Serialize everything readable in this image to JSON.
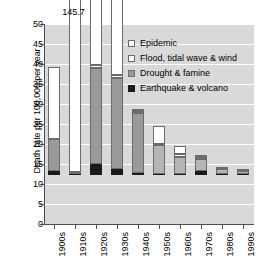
{
  "chart_data": {
    "type": "bar",
    "subtype": "stacked-bar",
    "title": "",
    "xlabel": "",
    "ylabel": "Death rate per 100,000 per year",
    "ylim": [
      0,
      50
    ],
    "ytick_step": 5,
    "yticks": [
      0,
      5,
      10,
      15,
      20,
      25,
      30,
      35,
      40,
      45,
      50
    ],
    "grid": true,
    "grid_orientation": "horizontal",
    "legend_position": "upper-right-inside",
    "categories": [
      "1900s",
      "1910s",
      "1920s",
      "1930s",
      "1940s",
      "1950s",
      "1960s",
      "1970s",
      "1980s",
      "1990s"
    ],
    "series": [
      {
        "name": "Earthquake & volcano",
        "color": "#1a1a1a",
        "values": [
          1.0,
          0.3,
          2.8,
          1.5,
          0.6,
          0.2,
          0.3,
          1.0,
          0.2,
          0.2
        ]
      },
      {
        "name": "Drought & famine",
        "color": "#9a9a9a",
        "values": [
          8.0,
          0.5,
          24.0,
          22.8,
          15.0,
          7.3,
          4.3,
          2.9,
          1.2,
          0.9
        ]
      },
      {
        "name": "Flood, tidal wave & wind",
        "color": "#ffffff",
        "values": [
          18.0,
          144.9,
          0.6,
          0.6,
          0.3,
          0.3,
          0.7,
          0.5,
          0.3,
          0.3
        ]
      },
      {
        "name": "Epidemic",
        "color": "#ffffff",
        "values": [
          0.0,
          0.0,
          16.9,
          22.3,
          0.2,
          4.4,
          1.9,
          0.4,
          0.0,
          0.0
        ]
      }
    ],
    "totals": [
      27.0,
      145.7,
      44.3,
      47.2,
      16.1,
      12.2,
      7.2,
      4.8,
      1.7,
      1.4
    ],
    "annotations": [
      {
        "text": "145.7",
        "category": "1910s",
        "note": "bar value exceeds axis maximum"
      }
    ]
  },
  "legend": {
    "items": [
      {
        "label": "Epidemic",
        "swatch": "epidemic"
      },
      {
        "label": "Flood, tidal wave & wind",
        "swatch": "flood"
      },
      {
        "label": "Drought & famine",
        "swatch": "drought"
      },
      {
        "label": "Earthquake & volcano",
        "swatch": "quake"
      }
    ]
  },
  "axis": {
    "y_title": "Death rate per 100,000 per year",
    "y_labels": [
      "50",
      "45",
      "40",
      "35",
      "30",
      "25",
      "20",
      "15",
      "10",
      "5",
      "0"
    ],
    "x_labels": [
      "1900s",
      "1910s",
      "1920s",
      "1930s",
      "1940s",
      "1950s",
      "1960s",
      "1970s",
      "1980s",
      "1990s"
    ]
  },
  "overflow_annotation": {
    "value": "145.7"
  }
}
